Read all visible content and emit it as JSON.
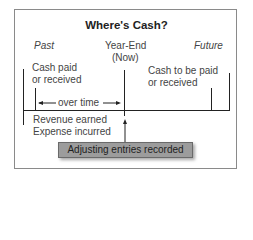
{
  "title": "Where's Cash?",
  "timeline": {
    "past_label": "Past",
    "now_label_line1": "Year-End",
    "now_label_line2": "(Now)",
    "future_label": "Future"
  },
  "past_box": {
    "line1": "Cash paid",
    "line2": "or received"
  },
  "future_box": {
    "line1": "Cash to be paid",
    "line2": "or received"
  },
  "span_label": "over time",
  "period_events": {
    "line1": "Revenue earned",
    "line2": "Expense incurred"
  },
  "callout": "Adjusting entries recorded",
  "colors": {
    "line": "#222222",
    "callout_fill": "#9c9c9c",
    "frame_border": "#8a8a8a"
  }
}
